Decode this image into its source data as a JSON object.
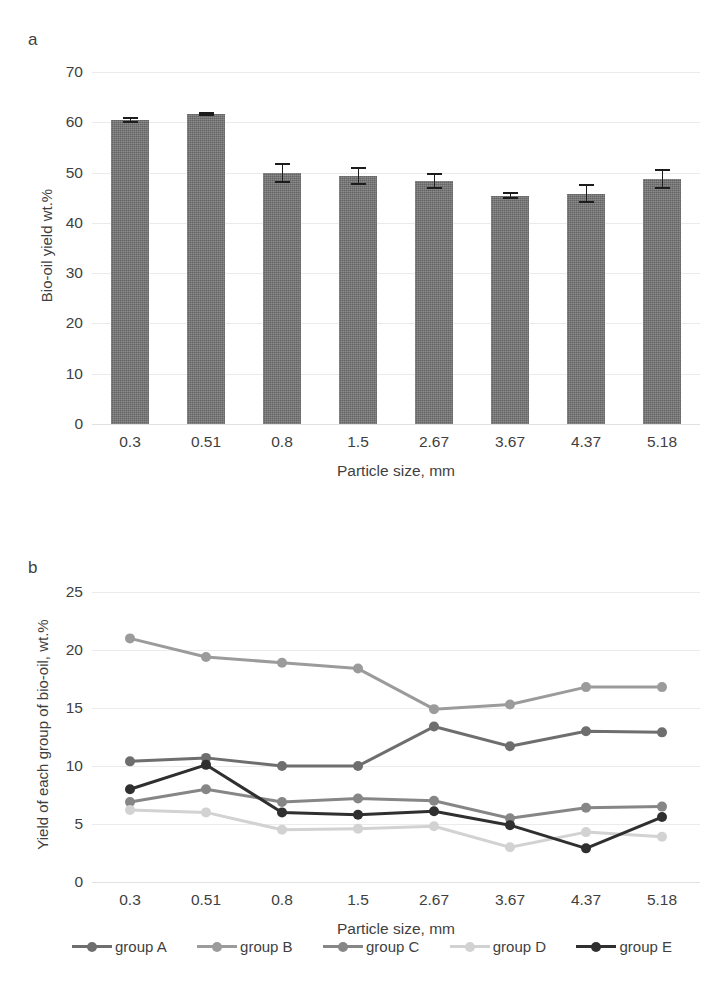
{
  "figure": {
    "panel_a_label": "a",
    "panel_b_label": "b"
  },
  "chart_data": [
    {
      "id": "panel-a",
      "type": "bar",
      "title": "",
      "panel_label": "a",
      "xlabel": "Particle size, mm",
      "ylabel": "Bio-oil yield wt.%",
      "categories": [
        "0.3",
        "0.51",
        "0.8",
        "1.5",
        "2.67",
        "3.67",
        "4.37",
        "5.18"
      ],
      "values": [
        60.5,
        61.7,
        50.0,
        49.3,
        48.4,
        45.4,
        45.8,
        48.7
      ],
      "errors": [
        0.6,
        0.4,
        2.0,
        1.8,
        1.6,
        0.7,
        1.9,
        2.0
      ],
      "ylim": [
        0,
        70
      ],
      "yticks": [
        0,
        10,
        20,
        30,
        40,
        50,
        60,
        70
      ],
      "ytick_labels": [
        "0",
        "10",
        "20",
        "30",
        "40",
        "50",
        "60",
        "70"
      ],
      "grid": true,
      "bar_color": "#737373",
      "error_color": "#1c1c1c",
      "legend": "none"
    },
    {
      "id": "panel-b",
      "type": "line",
      "title": "",
      "panel_label": "b",
      "xlabel": "Particle size, mm",
      "ylabel": "Yield of each group of bio-oil, wt.%",
      "categories": [
        "0.3",
        "0.51",
        "0.8",
        "1.5",
        "2.67",
        "3.67",
        "4.37",
        "5.18"
      ],
      "ylim": [
        0,
        25
      ],
      "yticks": [
        0,
        5,
        10,
        15,
        20,
        25
      ],
      "ytick_labels": [
        "0",
        "5",
        "10",
        "15",
        "20",
        "25"
      ],
      "grid": true,
      "legend_position": "bottom",
      "series": [
        {
          "name": "group A",
          "color": "#6e6e6e",
          "values": [
            10.4,
            10.7,
            10.0,
            10.0,
            13.4,
            11.7,
            13.0,
            12.9
          ]
        },
        {
          "name": "group B",
          "color": "#9b9b9b",
          "values": [
            21.0,
            19.4,
            18.9,
            18.4,
            14.9,
            15.3,
            16.8,
            16.8
          ]
        },
        {
          "name": "group C",
          "color": "#868686",
          "values": [
            6.9,
            8.0,
            6.9,
            7.2,
            7.0,
            5.5,
            6.4,
            6.5
          ]
        },
        {
          "name": "group D",
          "color": "#d2d2d2",
          "values": [
            6.2,
            6.0,
            4.5,
            4.6,
            4.8,
            3.0,
            4.3,
            3.9
          ]
        },
        {
          "name": "group E",
          "color": "#2f2f2f",
          "values": [
            8.0,
            10.1,
            6.0,
            5.8,
            6.1,
            4.9,
            2.9,
            5.6
          ]
        }
      ]
    }
  ]
}
